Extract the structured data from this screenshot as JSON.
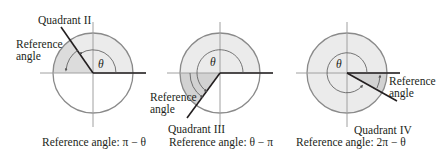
{
  "figure": {
    "colors": {
      "circle_stroke": "#8a8a8a",
      "circle_fill": "#ebebeb",
      "reference_fill": "#d2d2d2",
      "axis": "#9a9a9a",
      "ray": "#231f20",
      "text": "#231f20"
    },
    "panels": [
      {
        "quadrant_label": "Quadrant II",
        "reference_label_line1": "Reference",
        "reference_label_line2": "angle",
        "theta_symbol": "θ",
        "caption": "Reference angle: π − θ"
      },
      {
        "quadrant_label": "Quadrant III",
        "reference_label_line1": "Reference",
        "reference_label_line2": "angle",
        "theta_symbol": "θ",
        "caption": "Reference angle: θ − π"
      },
      {
        "quadrant_label": "Quadrant IV",
        "reference_label_line1": "Reference",
        "reference_label_line2": "angle",
        "theta_symbol": "θ",
        "caption": "Reference angle: 2π − θ"
      }
    ]
  }
}
